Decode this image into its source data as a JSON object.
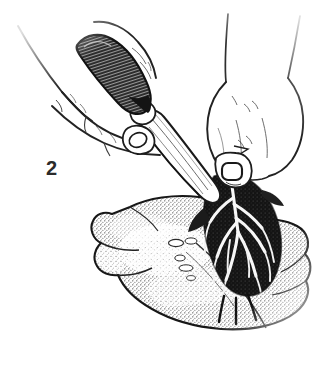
{
  "figure": {
    "kind": "line-art-illustration",
    "medium": "pen-and-ink stipple engraving",
    "caption_number": "2",
    "background_color": "#ffffff",
    "ink_color": "#1a1a1a",
    "stipple_color": "#3c3c3c",
    "width_px": 334,
    "height_px": 365,
    "elements": [
      {
        "name": "left-hand",
        "label": "Left hand gripping knife",
        "position": "upper left",
        "rendering": "thin contour outlines, no shading"
      },
      {
        "name": "knife-handle",
        "label": "Knife handle",
        "position": "upper left center",
        "rendering": "dark solid form with fine parallel hatching"
      },
      {
        "name": "knife-blade",
        "label": "Knife blade",
        "position": "diagonal, center",
        "rendering": "long tapered outline with interior highlight lines, tip pointing down-right"
      },
      {
        "name": "right-hand",
        "label": "Right hand holding the sinew flap",
        "position": "upper right",
        "rendering": "thin contour outlines with small thumbnail oval"
      },
      {
        "name": "meat-slab",
        "label": "Cut of meat",
        "position": "lower center",
        "rendering": "broad irregular slab rendered in dense stipple dots"
      },
      {
        "name": "sinew-membrane",
        "label": "Branching sinew and silverskin",
        "position": "center right of slab",
        "rendering": "dark branching vein-like mass pulled up from the surface"
      },
      {
        "name": "fat-nodules",
        "label": "Small fat nodules",
        "position": "center of slab",
        "rendering": "two or three small white ovals reserved in the stipple"
      }
    ]
  }
}
